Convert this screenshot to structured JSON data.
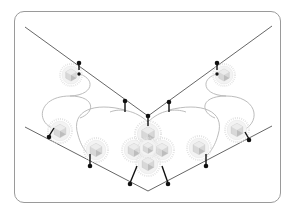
{
  "diagram": {
    "colors": {
      "frame": "#9a9a9a",
      "membrane": "#555555",
      "loop": "#b4b4b4",
      "cage_fill": "#d6d6d6",
      "cage_dark": "#b8b8b8",
      "halo": "#e2e2e2",
      "pin": "#111111"
    },
    "upper_v": {
      "left": [
        25,
        27
      ],
      "apex": [
        148,
        116
      ],
      "right": [
        272,
        26
      ]
    },
    "lower_v": {
      "left": [
        25,
        127
      ],
      "apex": [
        148,
        191
      ],
      "right": [
        272,
        126
      ]
    },
    "cages": [
      {
        "id": "cage-top-left",
        "cx": 71,
        "cy": 75,
        "r": 11
      },
      {
        "id": "cage-top-right",
        "cx": 224,
        "cy": 75,
        "r": 11
      },
      {
        "id": "cage-mid-left",
        "cx": 60,
        "cy": 131,
        "r": 12
      },
      {
        "id": "cage-mid-right",
        "cx": 237,
        "cy": 130,
        "r": 12
      },
      {
        "id": "cage-low-left",
        "cx": 96,
        "cy": 150,
        "r": 12
      },
      {
        "id": "cage-low-right",
        "cx": 199,
        "cy": 148,
        "r": 12
      },
      {
        "id": "cage-center",
        "cx": 148,
        "cy": 148,
        "r": 26
      }
    ],
    "pins": [
      {
        "x1": 79,
        "y1": 63,
        "x2": 79,
        "y2": 70
      },
      {
        "x1": 125,
        "y1": 101,
        "x2": 125,
        "y2": 112
      },
      {
        "x1": 148,
        "y1": 116,
        "x2": 148,
        "y2": 126
      },
      {
        "x1": 169,
        "y1": 102,
        "x2": 169,
        "y2": 112
      },
      {
        "x1": 217,
        "y1": 63,
        "x2": 217,
        "y2": 70
      },
      {
        "x1": 49,
        "y1": 136,
        "x2": 54,
        "y2": 128
      },
      {
        "x1": 90,
        "y1": 165,
        "x2": 90,
        "y2": 154
      },
      {
        "x1": 130,
        "y1": 183,
        "x2": 137,
        "y2": 166
      },
      {
        "x1": 168,
        "y1": 183,
        "x2": 162,
        "y2": 166
      },
      {
        "x1": 206,
        "y1": 165,
        "x2": 206,
        "y2": 154
      },
      {
        "x1": 249,
        "y1": 139,
        "x2": 245,
        "y2": 132
      }
    ]
  }
}
